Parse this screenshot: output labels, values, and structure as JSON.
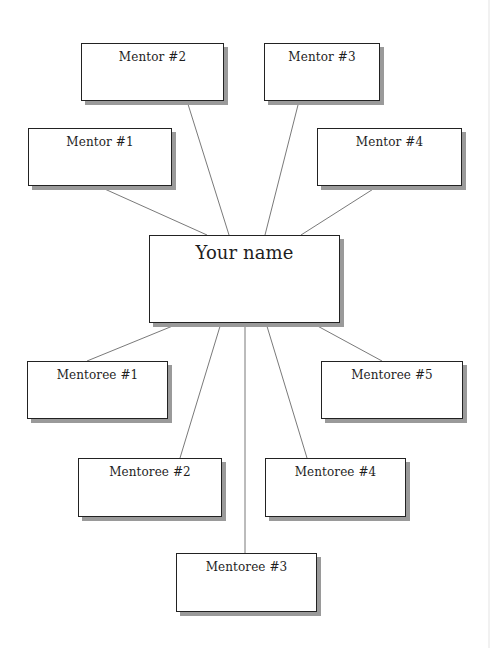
{
  "diagram": {
    "type": "mentoring-map",
    "center": {
      "label": "Your name",
      "box": {
        "x": 149,
        "y": 235,
        "w": 191,
        "h": 88
      }
    },
    "mentors": [
      {
        "label": "Mentor #1",
        "box": {
          "x": 28,
          "y": 128,
          "w": 144,
          "h": 58
        }
      },
      {
        "label": "Mentor #2",
        "box": {
          "x": 81,
          "y": 43,
          "w": 143,
          "h": 58
        }
      },
      {
        "label": "Mentor #3",
        "box": {
          "x": 264,
          "y": 43,
          "w": 116,
          "h": 58
        }
      },
      {
        "label": "Mentor #4",
        "box": {
          "x": 317,
          "y": 128,
          "w": 145,
          "h": 58
        }
      }
    ],
    "mentorees": [
      {
        "label": "Mentoree #1",
        "box": {
          "x": 27,
          "y": 361,
          "w": 141,
          "h": 58
        }
      },
      {
        "label": "Mentoree #2",
        "box": {
          "x": 78,
          "y": 458,
          "w": 144,
          "h": 59
        }
      },
      {
        "label": "Mentoree #3",
        "box": {
          "x": 176,
          "y": 553,
          "w": 141,
          "h": 59
        }
      },
      {
        "label": "Mentoree #4",
        "box": {
          "x": 265,
          "y": 458,
          "w": 141,
          "h": 59
        }
      },
      {
        "label": "Mentoree #5",
        "box": {
          "x": 321,
          "y": 361,
          "w": 142,
          "h": 58
        }
      }
    ],
    "connectors": [
      {
        "from": "mentor-1",
        "x1": 98,
        "y1": 186,
        "x2": 207,
        "y2": 235
      },
      {
        "from": "mentor-2",
        "x1": 187,
        "y1": 101,
        "x2": 229,
        "y2": 235
      },
      {
        "from": "mentor-3",
        "x1": 299,
        "y1": 101,
        "x2": 265,
        "y2": 235
      },
      {
        "from": "mentor-4",
        "x1": 378,
        "y1": 186,
        "x2": 301,
        "y2": 235
      },
      {
        "to": "mentoree-1",
        "x1": 180,
        "y1": 323,
        "x2": 87,
        "y2": 361
      },
      {
        "to": "mentoree-2",
        "x1": 221,
        "y1": 323,
        "x2": 180,
        "y2": 458
      },
      {
        "to": "mentoree-3",
        "x1": 245,
        "y1": 323,
        "x2": 245,
        "y2": 553
      },
      {
        "to": "mentoree-4",
        "x1": 266,
        "y1": 323,
        "x2": 307,
        "y2": 458
      },
      {
        "to": "mentoree-5",
        "x1": 312,
        "y1": 323,
        "x2": 382,
        "y2": 361
      }
    ],
    "colors": {
      "border": "#222222",
      "shadow": "#9a9a9a",
      "connector": "#6a6a6a",
      "text": "#1e1e1e",
      "background": "#ffffff"
    }
  }
}
